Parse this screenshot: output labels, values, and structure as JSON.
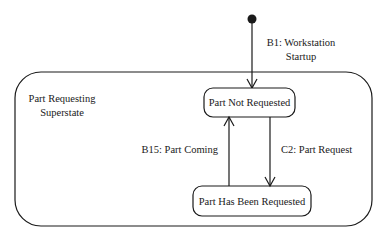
{
  "diagram": {
    "type": "state-diagram",
    "superstate": {
      "label_line1": "Part Requesting",
      "label_line2": "Superstate"
    },
    "initial_transition": {
      "label_line1": "B1: Workstation",
      "label_line2": "Startup"
    },
    "states": [
      {
        "id": "not_requested",
        "label": "Part Not Requested"
      },
      {
        "id": "has_been_requested",
        "label": "Part Has Been Requested"
      }
    ],
    "transitions": [
      {
        "from": "not_requested",
        "to": "has_been_requested",
        "label": "C2: Part Request"
      },
      {
        "from": "has_been_requested",
        "to": "not_requested",
        "label": "B15: Part Coming"
      }
    ],
    "colors": {
      "line": "#1a1a1a",
      "background": "#ffffff"
    }
  }
}
